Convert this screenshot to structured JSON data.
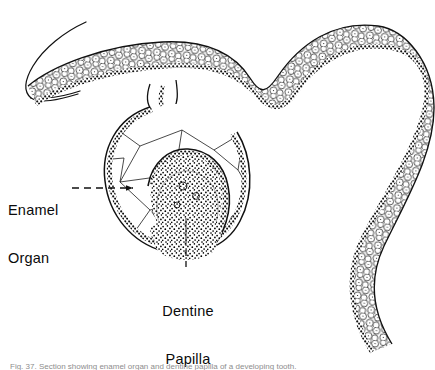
{
  "figure": {
    "style": "black and white line engraving, stippled shading",
    "ink_color": "#000000",
    "background_color": "#ffffff"
  },
  "labels": {
    "enamel_organ": {
      "line1": "Enamel",
      "line2": "Organ"
    },
    "dentine_papilla": {
      "line1": "Dentine",
      "line2": "Papilla"
    }
  },
  "leaders": {
    "enamel_organ": {
      "style": "dashed",
      "orientation": "horizontal"
    },
    "dentine_papilla": {
      "style": "dashed",
      "orientation": "vertical"
    }
  },
  "caption": {
    "text": "Fig. 37. Section showing enamel organ and dentine papilla of a developing tooth.",
    "clipped": true
  },
  "structures": [
    {
      "name": "oral-epithelium-surface",
      "description": "thin hooked outline curving at upper left"
    },
    {
      "name": "epithelial-band",
      "description": "undulating S-shaped band of polygonal cells with dark basal layer"
    },
    {
      "name": "enamel-organ",
      "description": "bell-shaped cap of stellate reticulum enclosed by basal cell layer"
    },
    {
      "name": "dentine-papilla",
      "description": "dense stippled mesenchymal mass beneath the enamel organ"
    }
  ]
}
